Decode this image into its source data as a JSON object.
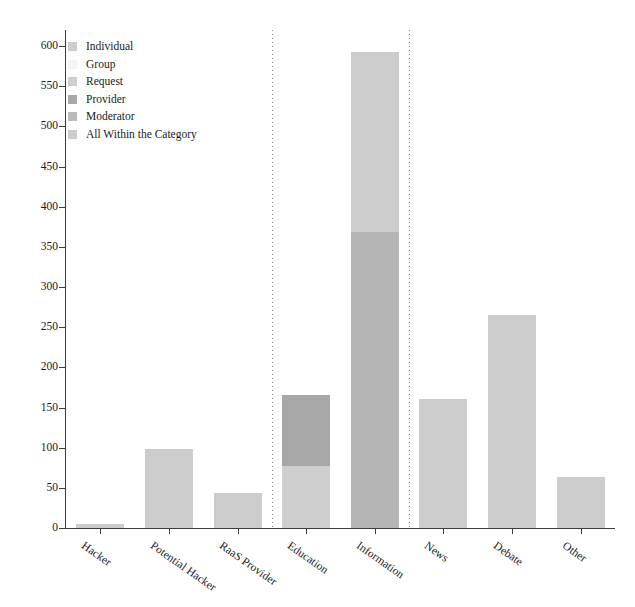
{
  "chart_data": {
    "type": "bar",
    "stacked": true,
    "title": "",
    "subtitle": "",
    "xlabel": "",
    "ylabel": "",
    "ylim": [
      0,
      620
    ],
    "xlim": [
      0,
      8
    ],
    "grid": false,
    "legend_position": "upper-left",
    "categories": [
      "Hacker",
      "Potential Hacker",
      "RaaS Provider",
      "Education",
      "Information",
      "News",
      "Debate",
      "Other"
    ],
    "y_ticks": [
      0,
      50,
      100,
      150,
      200,
      250,
      300,
      350,
      400,
      450,
      500,
      550,
      600
    ],
    "y_tick_labels": [
      "0",
      "50",
      "100",
      "150",
      "200",
      "250",
      "300",
      "350",
      "400",
      "450",
      "500",
      "550",
      "600"
    ],
    "series": [
      {
        "name": "Individual",
        "color": "#cccccc",
        "values": [
          5,
          98,
          44,
          0,
          0,
          0,
          0,
          0
        ]
      },
      {
        "name": "Group",
        "color": "#f2f2f2",
        "values": [
          0,
          0,
          0,
          0,
          0,
          0,
          0,
          0
        ]
      },
      {
        "name": "Request",
        "color": "#cfcfcf",
        "values": [
          0,
          0,
          0,
          77,
          0,
          0,
          0,
          0
        ]
      },
      {
        "name": "Provider",
        "color": "#a8a8a8",
        "values": [
          0,
          0,
          0,
          89,
          0,
          0,
          0,
          0
        ]
      },
      {
        "name": "Moderator",
        "color": "#b5b5b5",
        "values": [
          0,
          0,
          0,
          0,
          368,
          0,
          0,
          0
        ]
      },
      {
        "name": "All Within the Category",
        "color": "#cccccc",
        "values": [
          0,
          0,
          0,
          0,
          224,
          160,
          265,
          63
        ]
      }
    ],
    "bar_totals": [
      5,
      98,
      44,
      166,
      592,
      160,
      265,
      63
    ],
    "group_separators_after": [
      "RaaS Provider",
      "Information"
    ],
    "annotations": []
  },
  "legend": {
    "items": [
      {
        "label": "Individual",
        "color": "#cccccc"
      },
      {
        "label": "Group",
        "color": "#f4f4f4"
      },
      {
        "label": "Request",
        "color": "#cfcfcf"
      },
      {
        "label": "Provider",
        "color": "#a8a8a8"
      },
      {
        "label": "Moderator",
        "color": "#bcbcbc"
      },
      {
        "label": "All Within the Category",
        "color": "#cccccc"
      }
    ]
  },
  "axes": {
    "axis_color": "#3d3d3d",
    "tick_label_color": "#1a1a1a",
    "separator_color": "#9a9a9a"
  }
}
